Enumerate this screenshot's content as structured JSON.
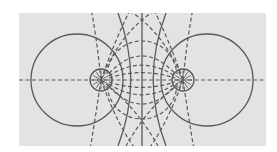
{
  "diagram": {
    "background_color": "#e3e3e3",
    "line_color": "#5a5a5a",
    "legend": {
      "field_lines": "dashed",
      "equipotentials": "solid"
    },
    "charges": [
      {
        "id": "left-charge",
        "sign": "point charge"
      },
      {
        "id": "right-charge",
        "sign": "point charge"
      }
    ],
    "equipotential_count_per_side": 3,
    "has_center_equipotential": true,
    "field_line_arcs_between_charges": 5
  }
}
